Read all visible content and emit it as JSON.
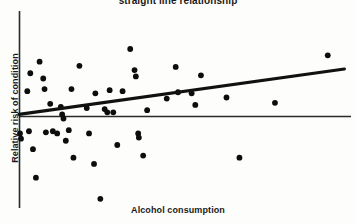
{
  "chart_data": {
    "type": "scatter",
    "title": "straight line relationship",
    "xlabel": "Alcohol consumption",
    "ylabel": "Relative risk of condition",
    "grid": false,
    "legend": null,
    "xlim": [
      0,
      100
    ],
    "ylim": [
      -100,
      100
    ],
    "baseline_y": 0,
    "annotations": [
      "Horizontal reference line drawn at zero relative risk",
      "Thick fitted straight regression line with positive slope"
    ],
    "trend_line": {
      "label": "fitted straight line",
      "x_start": 0,
      "y_start": 2,
      "x_end": 98,
      "y_end": 45,
      "slope": 0.44,
      "intercept": 2
    },
    "points": [
      {
        "x": 0.3,
        "y": -16
      },
      {
        "x": 0.6,
        "y": -21
      },
      {
        "x": 2.5,
        "y": 24
      },
      {
        "x": 3.0,
        "y": -14
      },
      {
        "x": 3.4,
        "y": 41
      },
      {
        "x": 4.2,
        "y": -31
      },
      {
        "x": 5.1,
        "y": -58
      },
      {
        "x": 6.2,
        "y": 52
      },
      {
        "x": 7.3,
        "y": 36
      },
      {
        "x": 7.7,
        "y": 26
      },
      {
        "x": 8.1,
        "y": -15
      },
      {
        "x": 9.4,
        "y": 12
      },
      {
        "x": 10.2,
        "y": -14
      },
      {
        "x": 11.5,
        "y": -16
      },
      {
        "x": 12.6,
        "y": 9
      },
      {
        "x": 13.0,
        "y": 2
      },
      {
        "x": 13.4,
        "y": -2
      },
      {
        "x": 14.1,
        "y": -23
      },
      {
        "x": 15.0,
        "y": -13
      },
      {
        "x": 15.8,
        "y": 26
      },
      {
        "x": 16.4,
        "y": -39
      },
      {
        "x": 18.2,
        "y": 48
      },
      {
        "x": 20.4,
        "y": 8
      },
      {
        "x": 21.1,
        "y": -16
      },
      {
        "x": 22.6,
        "y": -45
      },
      {
        "x": 23.0,
        "y": 22
      },
      {
        "x": 24.5,
        "y": -78
      },
      {
        "x": 25.8,
        "y": 7
      },
      {
        "x": 26.6,
        "y": 4
      },
      {
        "x": 27.3,
        "y": 25
      },
      {
        "x": 28.4,
        "y": 4
      },
      {
        "x": 29.6,
        "y": -27
      },
      {
        "x": 31.2,
        "y": 24
      },
      {
        "x": 33.5,
        "y": 64
      },
      {
        "x": 34.8,
        "y": 44
      },
      {
        "x": 35.2,
        "y": 38
      },
      {
        "x": 35.9,
        "y": -16
      },
      {
        "x": 36.1,
        "y": -20
      },
      {
        "x": 37.4,
        "y": -37
      },
      {
        "x": 38.6,
        "y": 6
      },
      {
        "x": 44.5,
        "y": 17
      },
      {
        "x": 47.2,
        "y": 47
      },
      {
        "x": 47.9,
        "y": 23
      },
      {
        "x": 52.0,
        "y": 22
      },
      {
        "x": 53.1,
        "y": 11
      },
      {
        "x": 54.8,
        "y": 39
      },
      {
        "x": 62.5,
        "y": 18
      },
      {
        "x": 66.4,
        "y": -39
      },
      {
        "x": 77.1,
        "y": 13
      },
      {
        "x": 93.0,
        "y": 58
      }
    ]
  }
}
